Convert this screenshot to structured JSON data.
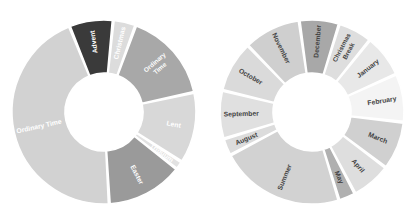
{
  "figure": {
    "background_color": "#ffffff",
    "width": 417,
    "height": 223
  },
  "chart_data": [
    {
      "type": "pie",
      "name": "liturgical-year-donut",
      "title": "",
      "subtitle": "",
      "xlabel": "",
      "ylabel": "",
      "legend_position": "none",
      "grid": false,
      "donut_hole_ratio": 0.42,
      "start_angle_deg": -22,
      "direction": "clockwise",
      "center": {
        "cx": 104,
        "cy": 112
      },
      "outer_radius": 92,
      "inner_radius": 39,
      "categories": [
        "Advent",
        "Christmas",
        "Ordinary Time",
        "Lent",
        "Triduum",
        "Easter",
        "Ordinary Time"
      ],
      "values": [
        7.7,
        4.0,
        16.0,
        12.5,
        1.5,
        13.5,
        44.8
      ],
      "colors": [
        "#3a3a3a",
        "#dcdcdc",
        "#a8a8a8",
        "#d8d8d8",
        "#e2e2e2",
        "#9a9a9a",
        "#d2d2d2"
      ],
      "label_colors": [
        "#ffffff",
        "#ffffff",
        "#ffffff",
        "#ffffff",
        "#ffffff",
        "#ffffff",
        "#ffffff"
      ],
      "labels": [
        {
          "text": "Advent",
          "lines": [
            "Advent"
          ]
        },
        {
          "text": "Christmas",
          "lines": [
            "Christmas"
          ]
        },
        {
          "text": "Ordinary Time",
          "lines": [
            "Ordinary",
            "Time"
          ]
        },
        {
          "text": "Lent",
          "lines": [
            "Lent"
          ]
        },
        {
          "text": "Triduum",
          "lines": [
            "Triduum"
          ]
        },
        {
          "text": "Easter",
          "lines": [
            "Easter"
          ]
        },
        {
          "text": "Ordinary Time",
          "lines": [
            "Ordinary Time"
          ]
        }
      ]
    },
    {
      "type": "pie",
      "name": "academic-year-donut",
      "title": "",
      "subtitle": "",
      "xlabel": "",
      "ylabel": "",
      "legend_position": "none",
      "grid": false,
      "donut_hole_ratio": 0.42,
      "start_angle_deg": -8,
      "direction": "clockwise",
      "center": {
        "cx": 104,
        "cy": 112
      },
      "outer_radius": 92,
      "inner_radius": 39,
      "categories": [
        "December",
        "Christmas Break",
        "January",
        "February",
        "March",
        "April",
        "May",
        "Summer",
        "August",
        "September",
        "October",
        "November"
      ],
      "values": [
        7.0,
        6.0,
        7.5,
        8.5,
        8.5,
        7.0,
        3.0,
        22.0,
        3.0,
        8.5,
        9.0,
        10.0
      ],
      "colors": [
        "#a8a8a8",
        "#dedede",
        "#e8e8e8",
        "#f4f4f4",
        "#d0d0d0",
        "#dedede",
        "#b0b0b0",
        "#d2d2d2",
        "#dcdcdc",
        "#e0e0e0",
        "#dadada",
        "#cfcfcf"
      ],
      "label_colors": [
        "#444444",
        "#444444",
        "#444444",
        "#444444",
        "#444444",
        "#444444",
        "#444444",
        "#444444",
        "#444444",
        "#444444",
        "#444444",
        "#444444"
      ],
      "labels": [
        {
          "text": "December",
          "lines": [
            "December"
          ]
        },
        {
          "text": "Christmas Break",
          "lines": [
            "Christmas",
            "Break"
          ]
        },
        {
          "text": "January",
          "lines": [
            "January"
          ]
        },
        {
          "text": "February",
          "lines": [
            "February"
          ]
        },
        {
          "text": "March",
          "lines": [
            "March"
          ]
        },
        {
          "text": "April",
          "lines": [
            "April"
          ]
        },
        {
          "text": "May",
          "lines": [
            "May"
          ]
        },
        {
          "text": "Summer",
          "lines": [
            "Summer"
          ]
        },
        {
          "text": "August",
          "lines": [
            "August"
          ]
        },
        {
          "text": "September",
          "lines": [
            "September"
          ]
        },
        {
          "text": "October",
          "lines": [
            "October"
          ]
        },
        {
          "text": "November",
          "lines": [
            "November"
          ]
        }
      ]
    }
  ]
}
